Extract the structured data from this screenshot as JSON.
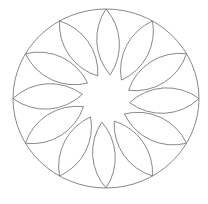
{
  "diagram": {
    "type": "rosette",
    "canvas": {
      "width": 208,
      "height": 204,
      "background": "#ffffff"
    },
    "stroke_color": "#7a7a7a",
    "outer_circle": {
      "cx": 106,
      "cy": 98.5,
      "rx": 93,
      "ry": 89.5
    },
    "petals": {
      "count": 12,
      "outer_tip_start_angle_deg": -90,
      "angle_step_deg": 30,
      "inner_tip_radius": 24,
      "inner_tip_angle_offset_deg": 10,
      "arc_radius": 54
    }
  }
}
